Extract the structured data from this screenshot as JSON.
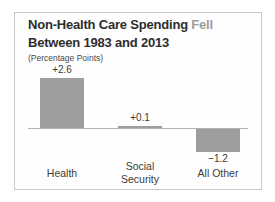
{
  "title": {
    "line1_dark": "Non-Health Care Spending",
    "line1_gray": "Fell",
    "line2": "Between 1983 and 2013"
  },
  "subtitle": "(Percentage Points)",
  "colors": {
    "bar": "#9e9e9e",
    "title_dark": "#2d2d2d",
    "title_gray": "#9d9d9d",
    "axis_line": "#b3b3b3",
    "card_border": "#c8c8c8",
    "label_text": "#3b3b3b"
  },
  "chart_data": {
    "type": "bar",
    "categories": [
      "Health",
      "Social Security",
      "All Other"
    ],
    "values": [
      2.6,
      0.1,
      -1.2
    ],
    "value_labels": [
      "+2.6",
      "+0.1",
      "−1.2"
    ],
    "title": "Non-Health Care Spending Fell Between 1983 and 2013",
    "subtitle": "(Percentage Points)",
    "xlabel": "",
    "ylabel": "",
    "ylim": [
      -1.5,
      3
    ],
    "grid": false,
    "legend": false,
    "baseline": 0,
    "bar_color": "#9e9e9e"
  }
}
